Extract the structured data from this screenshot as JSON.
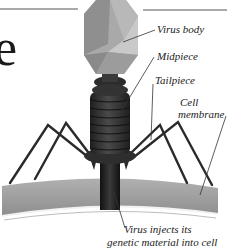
{
  "figure": {
    "partial_heading_letter": "e",
    "labels": {
      "virus_body": "Virus body",
      "midpiece": "Midpiece",
      "tailpiece": "Tailpiece",
      "cell_membrane_line1": "Cell",
      "cell_membrane_line2": "membrane",
      "inject_line1": "Virus injects its",
      "inject_line2": "genetic material into cell"
    },
    "colors": {
      "head_light": "#c9c9c9",
      "head_mid": "#a9a9a9",
      "head_dark": "#8a8a8a",
      "tail": "#3a3a3a",
      "legs": "#2a2a2a",
      "membrane": "#9e9e9e",
      "membrane_edge": "#e8e8e8",
      "rule_line": "#555555",
      "text": "#222222"
    }
  }
}
